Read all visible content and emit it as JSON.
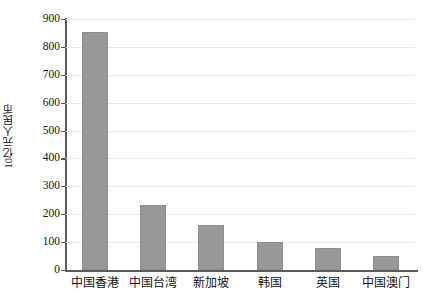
{
  "chart_data": {
    "type": "bar",
    "title": "",
    "xlabel": "",
    "ylabel": "10亿元人民币",
    "categories": [
      "中国香港",
      "中国台湾",
      "新加坡",
      "韩国",
      "英国",
      "中国澳门"
    ],
    "values": [
      855,
      235,
      160,
      100,
      78,
      52
    ],
    "ylim": [
      0,
      900
    ],
    "yticks": [
      0,
      100,
      200,
      300,
      400,
      500,
      600,
      700,
      800,
      900
    ],
    "ytick_labels": [
      "0",
      "100",
      "200",
      "300",
      "400",
      "500",
      "600",
      "700",
      "800",
      "900"
    ],
    "grid": true,
    "legend": false,
    "legend_position": "none",
    "series": [
      {
        "name": "",
        "values": [
          855,
          235,
          160,
          100,
          78,
          52
        ]
      }
    ],
    "colors": {
      "bar_fill": "#989898",
      "bar_edge": "#8d8d8d",
      "axis": "#5b5b5b",
      "grid": "#e9e9e9",
      "text": "#111111",
      "background": "#ffffff"
    }
  }
}
